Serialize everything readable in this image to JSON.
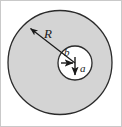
{
  "figure": {
    "canvas": {
      "width": 122,
      "height": 127,
      "background": "#ffffff"
    },
    "frame": {
      "visible": true,
      "color": "#c9c9c9"
    },
    "labels": {
      "outer_radius": "R",
      "offset_horizontal": "b",
      "offset_vertical": "a"
    },
    "colors": {
      "outer_fill": "#d4d4d4",
      "outer_stroke": "#2b2b2b",
      "inner_fill": "#ffffff",
      "inner_stroke": "#2b2b2b",
      "arrow": "#1a1a1a",
      "label_text": "#1a1a1a"
    },
    "geometry": {
      "outer_circle": {
        "cx": 60,
        "cy": 62.5,
        "r": 52
      },
      "inner_circle": {
        "cx": 75,
        "cy": 63,
        "r": 17
      },
      "radius_arrow": {
        "from_x": 75,
        "from_y": 63,
        "to_x": 29,
        "to_y": 27
      },
      "b_arrow": {
        "from_x": 64,
        "from_y": 63,
        "to_x": 75,
        "to_y": 63
      },
      "a_arrow": {
        "from_x": 75,
        "from_y": 57,
        "to_x": 75,
        "to_y": 77
      }
    },
    "label_positions": {
      "R": {
        "x": 44,
        "y": 37
      },
      "b": {
        "x": 65,
        "y": 55
      },
      "a": {
        "x": 80,
        "y": 71
      }
    }
  }
}
